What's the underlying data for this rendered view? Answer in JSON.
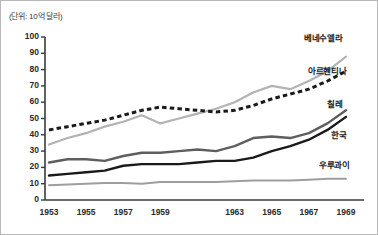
{
  "unit_note": "(단위: 10억 달러)",
  "chart_data": {
    "type": "line",
    "title": "",
    "subtitle": "",
    "xlabel": "",
    "ylabel": "",
    "unit_note": "(단위: 10억 달러)",
    "grid": false,
    "legend_position": "right-inline",
    "x": [
      1953,
      1954,
      1955,
      1956,
      1957,
      1958,
      1959,
      1960,
      1961,
      1962,
      1963,
      1964,
      1965,
      1966,
      1967,
      1968,
      1969
    ],
    "xticks": [
      "1953",
      "1955",
      "1957",
      "1959",
      "1963",
      "1965",
      "1967",
      "1969"
    ],
    "xtick_values": [
      1953,
      1955,
      1957,
      1959,
      1963,
      1965,
      1967,
      1969
    ],
    "yticks": [
      "0",
      "10",
      "20",
      "30",
      "40",
      "50",
      "60",
      "70",
      "80",
      "90",
      "100"
    ],
    "ytick_values": [
      0,
      10,
      20,
      30,
      40,
      50,
      60,
      70,
      80,
      90,
      100
    ],
    "ylim": [
      0,
      100
    ],
    "xlim": [
      1953,
      1969
    ],
    "series": [
      {
        "name": "베네수엘라",
        "label": "베네수엘라",
        "color": "#b3b3b3",
        "style": "solid",
        "width": 2.2,
        "values": [
          34,
          38,
          41,
          45,
          48,
          52,
          47,
          50,
          53,
          56,
          60,
          66,
          70,
          68,
          73,
          79,
          88
        ]
      },
      {
        "name": "아르헨티나",
        "label": "아르헨티나",
        "color": "#1a1a1a",
        "style": "dashed",
        "width": 3.0,
        "values": [
          43,
          45,
          47,
          49,
          52,
          55,
          57,
          56,
          55,
          54,
          55,
          58,
          62,
          65,
          68,
          73,
          79
        ]
      },
      {
        "name": "칠레",
        "label": "칠레",
        "color": "#5e5e5e",
        "style": "solid",
        "width": 2.4,
        "values": [
          23,
          25,
          25,
          24,
          27,
          29,
          29,
          30,
          31,
          30,
          33,
          38,
          39,
          38,
          41,
          47,
          55
        ]
      },
      {
        "name": "한국",
        "label": "한국",
        "color": "#1a1a1a",
        "style": "solid",
        "width": 2.4,
        "values": [
          15,
          16,
          17,
          18,
          21,
          22,
          22,
          22,
          23,
          24,
          24,
          26,
          30,
          33,
          37,
          43,
          51
        ]
      },
      {
        "name": "우루과이",
        "label": "우루과이",
        "color": "#9e9e9e",
        "style": "solid",
        "width": 2.0,
        "values": [
          9,
          9.5,
          10,
          10.5,
          10.5,
          10,
          11,
          11,
          11,
          11,
          11.5,
          12,
          12,
          12,
          12.5,
          13,
          13
        ]
      }
    ]
  },
  "axis": {
    "y_top_label": "100",
    "y_bottom_label": "0"
  }
}
